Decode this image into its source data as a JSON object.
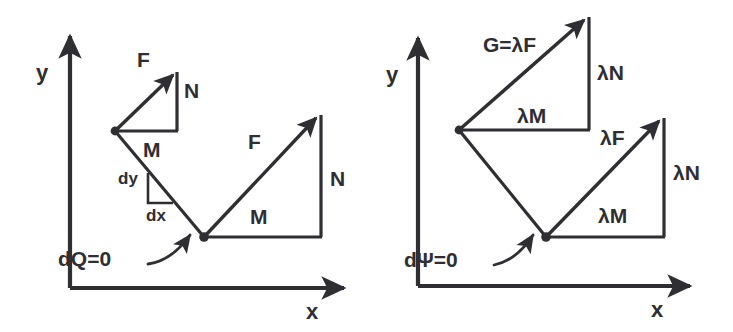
{
  "figure": {
    "background_color": "#ffffff",
    "ink_color": "#2e2e33"
  },
  "panels": [
    {
      "id": "left-panel",
      "name": "panel-dq",
      "axes": {
        "y_label": "y",
        "x_label": "x"
      },
      "labels": {
        "upper_triangle_hyp": "F",
        "upper_triangle_vert": "N",
        "upper_triangle_horz": "M",
        "dy": "dy",
        "dx": "dx",
        "callout": "dQ=0",
        "lower_triangle_hyp": "F",
        "lower_triangle_vert": "N",
        "lower_triangle_horz": "M"
      }
    },
    {
      "id": "right-panel",
      "name": "panel-dpsi",
      "axes": {
        "y_label": "y",
        "x_label": "x"
      },
      "labels": {
        "upper_triangle_hyp": "G=λF",
        "upper_triangle_vert": "λN",
        "upper_triangle_horz": "λM",
        "callout": "dΨ=0",
        "lower_triangle_hyp": "λF",
        "lower_triangle_vert": "λN",
        "lower_triangle_horz": "λM"
      }
    }
  ]
}
